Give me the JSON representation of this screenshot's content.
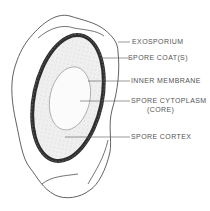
{
  "diagram": {
    "colors": {
      "background": "#ffffff",
      "line": "#3a3a3a",
      "coat": "#2e2e2e",
      "cortex_stipple": "#9a9a9a",
      "label_text": "#555555"
    },
    "labels": [
      {
        "id": "exosporium",
        "text": "EXOSPORIUM"
      },
      {
        "id": "spore-coat",
        "text": "SPORE COAT(S)"
      },
      {
        "id": "inner-membrane",
        "text": "INNER MEMBRANE"
      },
      {
        "id": "spore-cytoplasm",
        "text": "SPORE CYTOPLASM"
      },
      {
        "id": "spore-cytoplasm-sub",
        "text": "(CORE)"
      },
      {
        "id": "spore-cortex",
        "text": "SPORE CORTEX"
      }
    ]
  }
}
